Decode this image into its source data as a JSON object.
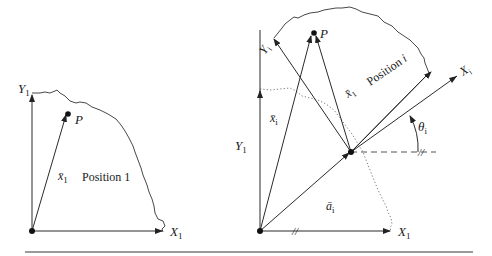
{
  "figure": {
    "left_panel": {
      "position_label": "Position 1",
      "axis_x_label": "X",
      "axis_x_sub": "1",
      "axis_y_label": "Y",
      "axis_y_sub": "1",
      "point_label": "P",
      "vector_label": "x̄",
      "vector_sub": "1"
    },
    "right_panel": {
      "position_label": "Position ",
      "position_index": "i",
      "fixed_x_label": "X",
      "fixed_x_sub": "1",
      "fixed_y_label": "Y",
      "fixed_y_sub": "1",
      "moving_x_label": "X",
      "moving_x_sub": "i",
      "moving_y_label": "Y",
      "moving_y_sub": "i",
      "point_label": "P",
      "vector_xi_label": "x̄",
      "vector_xi_sub": "i",
      "vector_x1_label": "x̄",
      "vector_x1_sub": "1",
      "vector_ai_label": "ā",
      "vector_ai_sub": "i",
      "angle_label": "θ",
      "angle_sub": "i",
      "parallel_mark": "//"
    }
  }
}
